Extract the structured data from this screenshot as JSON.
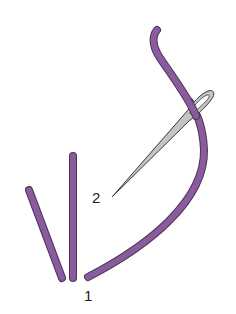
{
  "diagram": {
    "type": "embroidery stitch illustration",
    "colors": {
      "thread": "#8a5c9e",
      "thread_outline": "#4a3556",
      "needle": "#c4c4c4",
      "needle_outline": "#3a3a3a",
      "background": "#ffffff"
    },
    "labels": {
      "point_1": "1",
      "point_2": "2"
    },
    "elements": [
      {
        "name": "diagonal-stitch",
        "desc": "completed slanted stitch"
      },
      {
        "name": "vertical-stitch",
        "desc": "completed straight stitch"
      },
      {
        "name": "working-thread",
        "desc": "thread emerging at 1, looping through needle eye"
      },
      {
        "name": "needle",
        "desc": "needle inserted at 2"
      }
    ]
  }
}
